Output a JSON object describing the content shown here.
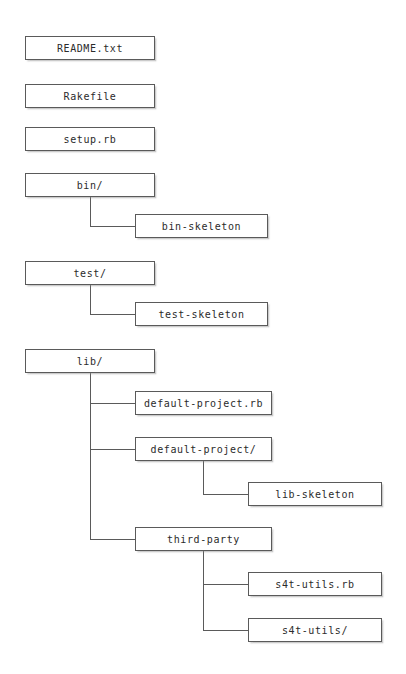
{
  "diagram": {
    "type": "tree",
    "canvas": {
      "width": 406,
      "height": 674
    },
    "style": {
      "background": "#ffffff",
      "box_fill": "#ffffff",
      "box_border": "#5a5a5a",
      "text_color": "#2b2b2b",
      "edge_color": "#5a5a5a",
      "shadow_color": "#8c8c8c"
    },
    "nodes": [
      {
        "id": "readme",
        "label": "README.txt",
        "x": 25,
        "y": 36,
        "w": 130,
        "h": 24,
        "depth": 0,
        "parent": null
      },
      {
        "id": "rakefile",
        "label": "Rakefile",
        "x": 25,
        "y": 84,
        "w": 130,
        "h": 24,
        "depth": 0,
        "parent": null
      },
      {
        "id": "setup-rb",
        "label": "setup.rb",
        "x": 25,
        "y": 127,
        "w": 130,
        "h": 24,
        "depth": 0,
        "parent": null
      },
      {
        "id": "bin-dir",
        "label": "bin/",
        "x": 25,
        "y": 173,
        "w": 130,
        "h": 24,
        "depth": 0,
        "parent": null
      },
      {
        "id": "bin-skeleton",
        "label": "bin-skeleton",
        "x": 135,
        "y": 214,
        "w": 133,
        "h": 24,
        "depth": 1,
        "parent": "bin-dir"
      },
      {
        "id": "test-dir",
        "label": "test/",
        "x": 25,
        "y": 261,
        "w": 130,
        "h": 24,
        "depth": 0,
        "parent": null
      },
      {
        "id": "test-skeleton",
        "label": "test-skeleton",
        "x": 135,
        "y": 302,
        "w": 133,
        "h": 24,
        "depth": 1,
        "parent": "test-dir"
      },
      {
        "id": "lib-dir",
        "label": "lib/",
        "x": 25,
        "y": 349,
        "w": 130,
        "h": 24,
        "depth": 0,
        "parent": null
      },
      {
        "id": "default-project-rb",
        "label": "default-project.rb",
        "x": 135,
        "y": 391,
        "w": 137,
        "h": 24,
        "depth": 1,
        "parent": "lib-dir"
      },
      {
        "id": "default-project-dir",
        "label": "default-project/",
        "x": 135,
        "y": 437,
        "w": 137,
        "h": 24,
        "depth": 1,
        "parent": "lib-dir"
      },
      {
        "id": "lib-skeleton",
        "label": "lib-skeleton",
        "x": 248,
        "y": 482,
        "w": 134,
        "h": 24,
        "depth": 2,
        "parent": "default-project-dir"
      },
      {
        "id": "third-party",
        "label": "third-party",
        "x": 135,
        "y": 527,
        "w": 137,
        "h": 24,
        "depth": 1,
        "parent": "lib-dir"
      },
      {
        "id": "s4t-utils-rb",
        "label": "s4t-utils.rb",
        "x": 248,
        "y": 572,
        "w": 134,
        "h": 24,
        "depth": 2,
        "parent": "third-party"
      },
      {
        "id": "s4t-utils-dir",
        "label": "s4t-utils/",
        "x": 248,
        "y": 618,
        "w": 134,
        "h": 24,
        "depth": 2,
        "parent": "third-party"
      }
    ],
    "edges": [
      {
        "id": "edge-bin-to-bin-skeleton",
        "from": "bin-dir",
        "to": "bin-skeleton",
        "trunk_x": 90,
        "trunk_y1": 197,
        "trunk_y2": 226,
        "branch_x2": 135
      },
      {
        "id": "edge-test-to-test-skeleton",
        "from": "test-dir",
        "to": "test-skeleton",
        "trunk_x": 90,
        "trunk_y1": 285,
        "trunk_y2": 314,
        "branch_x2": 135
      },
      {
        "id": "edge-lib-to-default-project-rb",
        "from": "lib-dir",
        "to": "default-project-rb",
        "trunk_x": 90,
        "trunk_y1": 373,
        "trunk_y2": 403,
        "branch_x2": 135
      },
      {
        "id": "edge-lib-to-default-project-dir",
        "from": "lib-dir",
        "to": "default-project-dir",
        "trunk_x": 90,
        "trunk_y1": 373,
        "trunk_y2": 449,
        "branch_x2": 135
      },
      {
        "id": "edge-lib-to-third-party",
        "from": "lib-dir",
        "to": "third-party",
        "trunk_x": 90,
        "trunk_y1": 373,
        "trunk_y2": 539,
        "branch_x2": 135
      },
      {
        "id": "edge-dp-to-lib-skeleton",
        "from": "default-project-dir",
        "to": "lib-skeleton",
        "trunk_x": 203,
        "trunk_y1": 461,
        "trunk_y2": 494,
        "branch_x2": 248
      },
      {
        "id": "edge-tp-to-s4t-utils-rb",
        "from": "third-party",
        "to": "s4t-utils-rb",
        "trunk_x": 203,
        "trunk_y1": 551,
        "trunk_y2": 584,
        "branch_x2": 248
      },
      {
        "id": "edge-tp-to-s4t-utils-dir",
        "from": "third-party",
        "to": "s4t-utils-dir",
        "trunk_x": 203,
        "trunk_y1": 551,
        "trunk_y2": 630,
        "branch_x2": 248
      }
    ]
  }
}
